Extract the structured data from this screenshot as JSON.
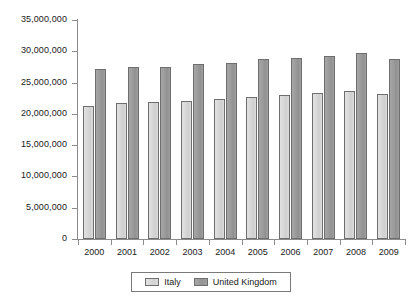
{
  "chart_data": {
    "type": "bar",
    "title": "",
    "subtitle": "",
    "xlabel": "",
    "ylabel": "",
    "categories": [
      "2000",
      "2001",
      "2002",
      "2003",
      "2004",
      "2005",
      "2006",
      "2007",
      "2008",
      "2009"
    ],
    "series": [
      {
        "name": "Italy",
        "color": "#d6d6d6",
        "values": [
          21200000,
          21700000,
          21900000,
          22100000,
          22400000,
          22700000,
          23000000,
          23400000,
          23600000,
          23100000
        ]
      },
      {
        "name": "United Kingdom",
        "color": "#969696",
        "values": [
          27200000,
          27500000,
          27500000,
          27900000,
          28100000,
          28700000,
          28900000,
          29200000,
          29700000,
          28800000
        ]
      }
    ],
    "ylim": [
      0,
      35000000
    ],
    "ytick_values": [
      0,
      5000000,
      10000000,
      15000000,
      20000000,
      25000000,
      30000000,
      35000000
    ],
    "ytick_labels": [
      "0",
      "5,000,000",
      "10,000,000",
      "15,000,000",
      "20,000,000",
      "25,000,000",
      "30,000,000",
      "35,000,000"
    ],
    "grid": false,
    "legend_position": "bottom-center"
  },
  "legend": {
    "entries": [
      {
        "label": "Italy",
        "swatch": "italy-swatch"
      },
      {
        "label": "United Kingdom",
        "swatch": "uk-swatch"
      }
    ]
  }
}
